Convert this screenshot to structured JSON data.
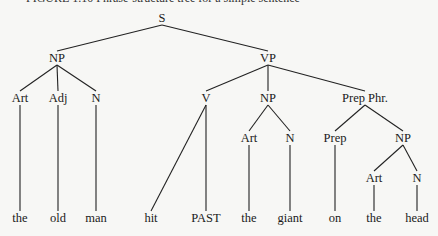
{
  "caption": "FIGURE 1.10  Phrase-structure tree for a simple sentence",
  "tree": {
    "nodes": [
      {
        "id": "S",
        "label": "S",
        "x": 162,
        "y": 18,
        "type": "cat"
      },
      {
        "id": "NP1",
        "label": "NP",
        "x": 57,
        "y": 58,
        "type": "cat"
      },
      {
        "id": "VP",
        "label": "VP",
        "x": 268,
        "y": 58,
        "type": "cat"
      },
      {
        "id": "Art1",
        "label": "Art",
        "x": 20,
        "y": 98,
        "type": "cat"
      },
      {
        "id": "Adj",
        "label": "Adj",
        "x": 58,
        "y": 98,
        "type": "cat"
      },
      {
        "id": "N1",
        "label": "N",
        "x": 96,
        "y": 98,
        "type": "cat"
      },
      {
        "id": "V",
        "label": "V",
        "x": 206,
        "y": 98,
        "type": "cat"
      },
      {
        "id": "NP2",
        "label": "NP",
        "x": 268,
        "y": 98,
        "type": "cat"
      },
      {
        "id": "PP",
        "label": "Prep Phr.",
        "x": 365,
        "y": 98,
        "type": "cat"
      },
      {
        "id": "Art2",
        "label": "Art",
        "x": 249,
        "y": 138,
        "type": "cat"
      },
      {
        "id": "N2",
        "label": "N",
        "x": 290,
        "y": 138,
        "type": "cat"
      },
      {
        "id": "Prep",
        "label": "Prep",
        "x": 335,
        "y": 138,
        "type": "cat"
      },
      {
        "id": "NP3",
        "label": "NP",
        "x": 403,
        "y": 138,
        "type": "cat"
      },
      {
        "id": "Art3",
        "label": "Art",
        "x": 374,
        "y": 178,
        "type": "cat"
      },
      {
        "id": "N3",
        "label": "N",
        "x": 417,
        "y": 178,
        "type": "cat"
      },
      {
        "id": "w1",
        "label": "the",
        "x": 20,
        "y": 218,
        "type": "leaf"
      },
      {
        "id": "w2",
        "label": "old",
        "x": 58,
        "y": 218,
        "type": "leaf"
      },
      {
        "id": "w3",
        "label": "man",
        "x": 96,
        "y": 218,
        "type": "leaf"
      },
      {
        "id": "w4",
        "label": "hit",
        "x": 151,
        "y": 218,
        "type": "leaf"
      },
      {
        "id": "w5",
        "label": "PAST",
        "x": 206,
        "y": 218,
        "type": "leaf"
      },
      {
        "id": "w6",
        "label": "the",
        "x": 249,
        "y": 218,
        "type": "leaf"
      },
      {
        "id": "w7",
        "label": "giant",
        "x": 290,
        "y": 218,
        "type": "leaf"
      },
      {
        "id": "w8",
        "label": "on",
        "x": 335,
        "y": 218,
        "type": "leaf"
      },
      {
        "id": "w9",
        "label": "the",
        "x": 374,
        "y": 218,
        "type": "leaf"
      },
      {
        "id": "w10",
        "label": "head",
        "x": 417,
        "y": 218,
        "type": "leaf"
      }
    ],
    "edges": [
      [
        "S",
        "NP1"
      ],
      [
        "S",
        "VP"
      ],
      [
        "NP1",
        "Art1"
      ],
      [
        "NP1",
        "Adj"
      ],
      [
        "NP1",
        "N1"
      ],
      [
        "VP",
        "V"
      ],
      [
        "VP",
        "NP2"
      ],
      [
        "VP",
        "PP"
      ],
      [
        "NP2",
        "Art2"
      ],
      [
        "NP2",
        "N2"
      ],
      [
        "PP",
        "Prep"
      ],
      [
        "PP",
        "NP3"
      ],
      [
        "NP3",
        "Art3"
      ],
      [
        "NP3",
        "N3"
      ],
      [
        "Art1",
        "w1"
      ],
      [
        "Adj",
        "w2"
      ],
      [
        "N1",
        "w3"
      ],
      [
        "V",
        "w4"
      ],
      [
        "V",
        "w5"
      ],
      [
        "Art2",
        "w6"
      ],
      [
        "N2",
        "w7"
      ],
      [
        "Prep",
        "w8"
      ],
      [
        "Art3",
        "w9"
      ],
      [
        "N3",
        "w10"
      ]
    ]
  }
}
